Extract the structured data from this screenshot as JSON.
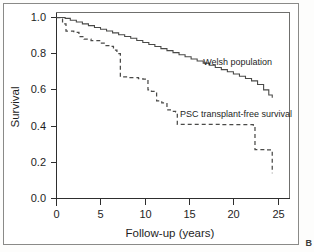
{
  "figure": {
    "panel_letter": "B"
  },
  "chart_data": {
    "type": "line",
    "subtype": "kaplan-meier-step",
    "title": "",
    "xlabel": "Follow-up (years)",
    "ylabel": "Survival",
    "xlim": [
      0,
      27
    ],
    "ylim": [
      0.0,
      1.05
    ],
    "grid": false,
    "legend_position": "inline-annotations",
    "x_ticks": [
      0,
      5,
      10,
      15,
      20,
      25
    ],
    "x_tick_labels": [
      "0",
      "5",
      "10",
      "15",
      "20",
      "25"
    ],
    "y_ticks": [
      0.0,
      0.2,
      0.4,
      0.6,
      0.8,
      1.0
    ],
    "y_tick_labels": [
      "0.0",
      "0.2",
      "0.4",
      "0.6",
      "0.8",
      "1.0"
    ],
    "series": [
      {
        "name": "Welsh population",
        "style": "solid",
        "annotation": "Welsh population",
        "annotation_x": 17.0,
        "annotation_y": 0.755,
        "x": [
          0,
          1,
          1.6,
          2.3,
          3.0,
          3.7,
          4.4,
          5.1,
          5.8,
          6.5,
          7.2,
          7.9,
          8.6,
          9.3,
          10.0,
          10.7,
          11.4,
          12.1,
          12.8,
          13.5,
          14.2,
          14.9,
          15.6,
          16.3,
          17.0,
          17.7,
          18.4,
          19.1,
          19.8,
          20.5,
          21.2,
          21.9,
          22.6,
          23.3,
          24.0,
          24.6,
          25.0
        ],
        "y": [
          1.0,
          0.995,
          0.985,
          0.975,
          0.965,
          0.955,
          0.945,
          0.935,
          0.925,
          0.915,
          0.905,
          0.895,
          0.885,
          0.873,
          0.862,
          0.851,
          0.84,
          0.828,
          0.817,
          0.806,
          0.794,
          0.783,
          0.771,
          0.76,
          0.748,
          0.736,
          0.724,
          0.712,
          0.7,
          0.688,
          0.675,
          0.663,
          0.65,
          0.63,
          0.6,
          0.572,
          0.556
        ]
      },
      {
        "name": "PSC transplant-free survival",
        "style": "dashed",
        "annotation": "PSC transplant-free survival",
        "annotation_x": 14.3,
        "annotation_y": 0.465,
        "x": [
          0,
          0.7,
          1.1,
          2.0,
          2.6,
          3.2,
          4.0,
          5.0,
          5.6,
          6.2,
          6.6,
          7.0,
          7.4,
          8.4,
          9.5,
          10.0,
          10.6,
          11.0,
          11.6,
          12.2,
          12.8,
          13.2,
          13.8,
          14.0,
          19.0,
          22.8,
          23.0,
          24.3,
          24.9,
          25.0
        ],
        "y": [
          1.0,
          0.965,
          0.925,
          0.918,
          0.895,
          0.88,
          0.872,
          0.858,
          0.845,
          0.84,
          0.82,
          0.8,
          0.672,
          0.668,
          0.662,
          0.66,
          0.6,
          0.592,
          0.54,
          0.528,
          0.49,
          0.482,
          0.478,
          0.41,
          0.408,
          0.406,
          0.27,
          0.268,
          0.266,
          0.14
        ]
      }
    ]
  },
  "annotations": {
    "welsh_population": "Welsh population",
    "psc_survival": "PSC transplant-free survival"
  }
}
